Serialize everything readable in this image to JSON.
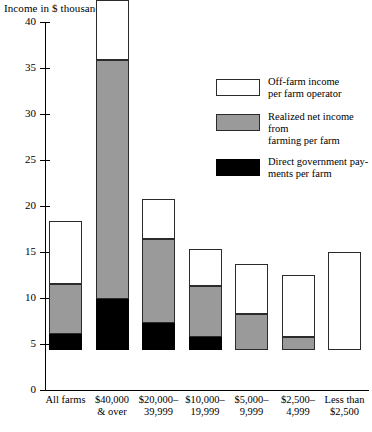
{
  "chart_data": {
    "type": "bar",
    "stacked": true,
    "title": "",
    "ylabel": "Income in $ thousands",
    "xlabel": "",
    "ylim": [
      0,
      40
    ],
    "yticks": [
      0,
      5,
      10,
      15,
      20,
      25,
      30,
      35,
      40
    ],
    "grid": false,
    "legend_position": "upper-right",
    "categories": [
      "All farms",
      "$40,000 & over",
      "$20,000–39,999",
      "$10,000–19,999",
      "$5,000–9,999",
      "$2,500–4,999",
      "Less than $2,500"
    ],
    "series": [
      {
        "name": "Direct government payments per farm",
        "color": "#000000",
        "values": [
          1.7,
          5.5,
          2.9,
          1.4,
          0.0,
          0.0,
          0.0
        ]
      },
      {
        "name": "Realized net income from farming per farm",
        "color": "#9a9a9a",
        "values": [
          5.5,
          26.0,
          9.2,
          5.6,
          3.9,
          1.4,
          0.0
        ]
      },
      {
        "name": "Off-farm income per farm operator",
        "color": "#ffffff",
        "values": [
          6.8,
          6.5,
          4.3,
          4.0,
          5.5,
          6.8,
          10.7
        ]
      }
    ],
    "totals": [
      14.0,
      38.0,
      16.4,
      11.0,
      9.4,
      8.2,
      10.7
    ]
  },
  "axis": {
    "y_title": "Income in $ thousands",
    "y_ticks": [
      "0",
      "5",
      "10",
      "15",
      "20",
      "25",
      "30",
      "35",
      "40"
    ]
  },
  "x_labels": [
    {
      "line1": "All farms",
      "line2": ""
    },
    {
      "line1": "$40,000",
      "line2": "& over"
    },
    {
      "line1": "$20,000–",
      "line2": "39,999"
    },
    {
      "line1": "$10,000–",
      "line2": "19,999"
    },
    {
      "line1": "$5,000–",
      "line2": "9,999"
    },
    {
      "line1": "$2,500–",
      "line2": "4,999"
    },
    {
      "line1": "Less than",
      "line2": "$2,500"
    }
  ],
  "legend": {
    "items": [
      {
        "swatch": "white",
        "line1": "Off-farm income",
        "line2": "per farm operator"
      },
      {
        "swatch": "gray",
        "line1": "Realized net income from",
        "line2": "farming per farm"
      },
      {
        "swatch": "black",
        "line1": "Direct government pay-",
        "line2": "ments per farm"
      }
    ]
  }
}
